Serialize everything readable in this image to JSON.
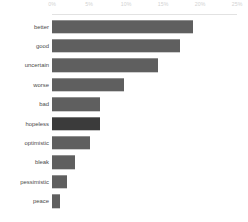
{
  "chart_data": {
    "type": "bar",
    "orientation": "horizontal",
    "title": "",
    "subtitle": "",
    "xlabel": "",
    "ylabel": "",
    "grid": false,
    "legend": null,
    "axis_position": "top",
    "xlim": [
      0,
      25
    ],
    "xticks": [
      0,
      5,
      10,
      15,
      20,
      25
    ],
    "xticklabels": [
      "0%",
      "5%",
      "10%",
      "15%",
      "20%",
      "25%"
    ],
    "categories": [
      "better",
      "good",
      "uncertain",
      "worse",
      "bad",
      "hopeless",
      "optimistic",
      "bleak",
      "pessimistic",
      "peace"
    ],
    "values": [
      19.1,
      17.3,
      14.3,
      9.7,
      6.5,
      6.5,
      5.1,
      3.1,
      2.0,
      1.1
    ],
    "highlight_category": "hopeless",
    "colors": {
      "bar": "#5f5f5f",
      "bar_highlight": "#3b3b3b",
      "tick_label": "#d2d2d2",
      "category_label": "#4a4a4a",
      "axis_rule": "#e2e2e2",
      "background": "#ffffff"
    }
  },
  "ticks": [
    {
      "label": "0%",
      "left_px": 52
    },
    {
      "label": "5%",
      "left_px": 89
    },
    {
      "label": "10%",
      "left_px": 126
    },
    {
      "label": "15%",
      "left_px": 163
    },
    {
      "label": "20%",
      "left_px": 200
    },
    {
      "label": "25%",
      "left_px": 237
    }
  ],
  "bars": [
    {
      "label": "better",
      "value": 19.1,
      "width_px": 141.4,
      "top_px": 2,
      "highlight": false
    },
    {
      "label": "good",
      "value": 17.3,
      "width_px": 128.0,
      "top_px": 21.4,
      "highlight": false
    },
    {
      "label": "uncertain",
      "value": 14.3,
      "width_px": 105.8,
      "top_px": 40.8,
      "highlight": false
    },
    {
      "label": "worse",
      "value": 9.7,
      "width_px": 71.8,
      "top_px": 60.2,
      "highlight": false
    },
    {
      "label": "bad",
      "value": 6.5,
      "width_px": 48.1,
      "top_px": 79.6,
      "highlight": false
    },
    {
      "label": "hopeless",
      "value": 6.5,
      "width_px": 48.1,
      "top_px": 99.0,
      "highlight": true
    },
    {
      "label": "optimistic",
      "value": 5.1,
      "width_px": 37.7,
      "top_px": 118.4,
      "highlight": false
    },
    {
      "label": "bleak",
      "value": 3.1,
      "width_px": 22.9,
      "top_px": 137.8,
      "highlight": false
    },
    {
      "label": "pessimistic",
      "value": 2.0,
      "width_px": 14.8,
      "top_px": 157.2,
      "highlight": false
    },
    {
      "label": "peace",
      "value": 1.1,
      "width_px": 8.1,
      "top_px": 176.6,
      "highlight": false
    }
  ]
}
